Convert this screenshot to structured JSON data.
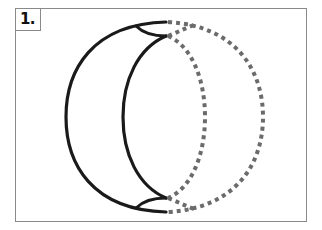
{
  "figure": {
    "label": "1.",
    "colors": {
      "frame": "#8a8a8a",
      "solid_stroke": "#1a1a1a",
      "dashed_stroke": "#6b6b6b",
      "background": "#ffffff"
    },
    "shapes": [
      {
        "name": "outer-solid-arc",
        "style": "solid"
      },
      {
        "name": "inner-solid-arc",
        "style": "solid"
      },
      {
        "name": "outer-dashed-arc",
        "style": "dashed"
      },
      {
        "name": "inner-dashed-arc",
        "style": "dashed"
      }
    ]
  }
}
